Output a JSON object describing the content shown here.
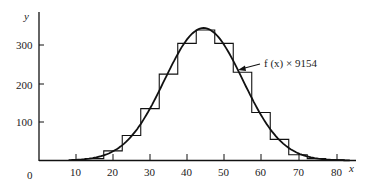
{
  "chart_data": {
    "type": "bar",
    "title": "",
    "xlabel": "x",
    "ylabel": "y",
    "xlim": [
      0,
      82
    ],
    "ylim": [
      0,
      360
    ],
    "grid": false,
    "x_ticks": [
      0,
      10,
      20,
      30,
      40,
      50,
      60,
      70,
      80
    ],
    "y_ticks": [
      100,
      200,
      300
    ],
    "bin_width": 5,
    "histogram": {
      "name": "observed frequencies",
      "bin_centers": [
        15,
        20,
        25,
        30,
        35,
        40,
        45,
        50,
        55,
        60,
        65,
        70,
        75,
        80
      ],
      "values": [
        5,
        25,
        65,
        135,
        225,
        305,
        340,
        305,
        230,
        125,
        55,
        15,
        5,
        2
      ]
    },
    "curve": {
      "name": "f(x) × 9154",
      "type": "line",
      "description": "normal density curve scaled by 9154",
      "mean": 44.5,
      "peak": 345,
      "sd": 10.6
    },
    "annotations": [
      {
        "text": "f (x) × 9154",
        "arrow_to_x": 52,
        "arrow_to_y": 235
      }
    ]
  },
  "labels": {
    "x_axis": "x",
    "y_axis": "y",
    "origin": "0",
    "annotation": "f (x) × 9154",
    "y_tick_100": "100",
    "y_tick_200": "200",
    "y_tick_300": "300",
    "x_tick_10": "10",
    "x_tick_20": "20",
    "x_tick_30": "30",
    "x_tick_40": "40",
    "x_tick_50": "50",
    "x_tick_60": "60",
    "x_tick_70": "70",
    "x_tick_80": "80"
  }
}
